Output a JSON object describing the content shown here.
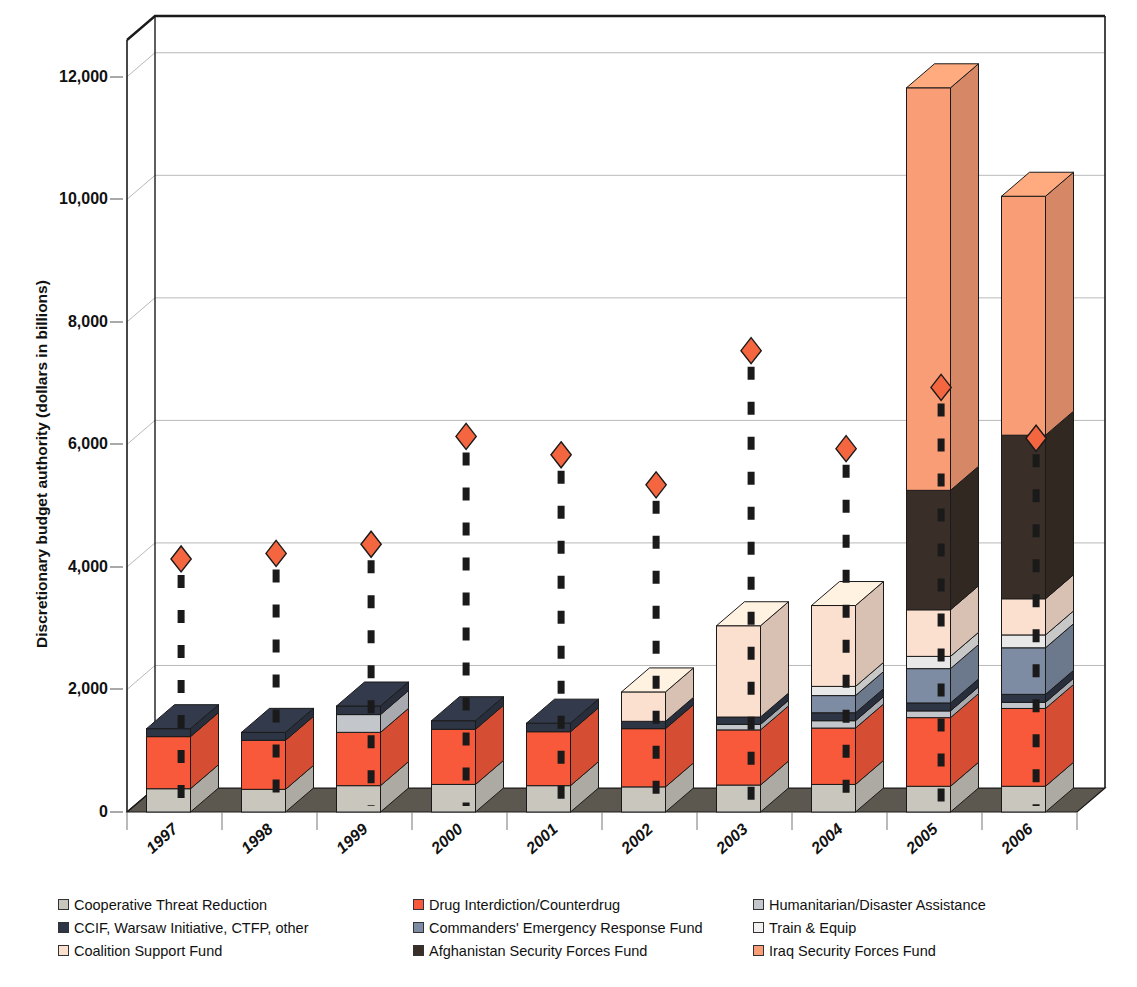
{
  "chart_data": {
    "type": "bar",
    "subtype": "stacked-bar-3d-with-scatter-overlay",
    "title": "",
    "xlabel": "",
    "ylabel": "Discretionary budget authority (dollars in billions)",
    "ylim": [
      0,
      12600
    ],
    "yticks": [
      0,
      2000,
      4000,
      6000,
      8000,
      10000,
      12000
    ],
    "ytick_labels": [
      "0",
      "2,000",
      "4,000",
      "6,000",
      "8,000",
      "10,000",
      "12,000"
    ],
    "grid": true,
    "legend_position": "bottom",
    "categories": [
      "1997",
      "1998",
      "1999",
      "2000",
      "2001",
      "2002",
      "2003",
      "2004",
      "2005",
      "2006"
    ],
    "series": [
      {
        "name": "Cooperative Threat Reduction",
        "color": "#c9c6bd",
        "values": [
          380,
          370,
          430,
          450,
          430,
          410,
          440,
          450,
          420,
          420
        ]
      },
      {
        "name": "Drug Interdiction/Counterdrug",
        "color": "#f8593a",
        "values": [
          850,
          800,
          870,
          900,
          880,
          950,
          900,
          920,
          1120,
          1270
        ]
      },
      {
        "name": "Humanitarian/Disaster Assistance",
        "color": "#c3c6cb",
        "values": [
          0,
          0,
          290,
          0,
          0,
          0,
          90,
          120,
          110,
          100
        ]
      },
      {
        "name": "CCIF, Warsaw Initiative, CTFP, other",
        "color": "#2e3645",
        "values": [
          130,
          130,
          140,
          140,
          140,
          120,
          120,
          130,
          130,
          130
        ]
      },
      {
        "name": "Commanders' Emergency Response Fund",
        "color": "#7d8ba3",
        "values": [
          0,
          0,
          0,
          0,
          0,
          0,
          0,
          280,
          560,
          760
        ]
      },
      {
        "name": "Train & Equip",
        "color": "#e8e8e8",
        "values": [
          0,
          0,
          0,
          0,
          0,
          0,
          0,
          150,
          200,
          210
        ]
      },
      {
        "name": "Coalition Support Fund",
        "color": "#fbe0d0",
        "values": [
          0,
          0,
          0,
          0,
          0,
          480,
          1490,
          1320,
          760,
          590
        ]
      },
      {
        "name": "Afghanistan Security Forces Fund",
        "color": "#3a2f28",
        "values": [
          0,
          0,
          0,
          0,
          0,
          0,
          0,
          0,
          1950,
          2670
        ]
      },
      {
        "name": "Iraq Security Forces Fund",
        "color": "#f99d76",
        "values": [
          0,
          0,
          0,
          0,
          0,
          0,
          0,
          0,
          6570,
          3900
        ]
      }
    ],
    "marker_series": {
      "name": "Total (diamond marker)",
      "marker": "diamond",
      "color": "#f4663f",
      "values": [
        4130,
        4220,
        4370,
        6130,
        5830,
        5340,
        7530,
        5930,
        6930,
        6100
      ]
    }
  },
  "axis": {
    "y_label": "Discretionary budget authority (dollars in billions)",
    "y_tick_labels": [
      "12,000",
      "10,000",
      "8,000",
      "6,000",
      "4,000",
      "2,000",
      "0"
    ],
    "x_tick_labels": [
      "1997",
      "1998",
      "1999",
      "2000",
      "2001",
      "2002",
      "2003",
      "2004",
      "2005",
      "2006"
    ]
  },
  "legend": {
    "items": [
      {
        "label": "Cooperative Threat Reduction",
        "color": "#c9c6bd"
      },
      {
        "label": "Drug Interdiction/Counterdrug",
        "color": "#f8593a"
      },
      {
        "label": "Humanitarian/Disaster Assistance",
        "color": "#c3c6cb"
      },
      {
        "label": "CCIF, Warsaw Initiative, CTFP, other",
        "color": "#2e3645"
      },
      {
        "label": "Commanders' Emergency Response Fund",
        "color": "#7d8ba3"
      },
      {
        "label": "Train & Equip",
        "color": "#f2f1ef"
      },
      {
        "label": "Coalition Support Fund",
        "color": "#fbe0d0"
      },
      {
        "label": "Afghanistan Security Forces Fund",
        "color": "#3a2f28"
      },
      {
        "label": "Iraq Security Forces Fund",
        "color": "#f99d76"
      }
    ]
  },
  "colors": {
    "floor": "#5c584f",
    "gridline": "#b9b9b9",
    "frame": "#1a1a1a",
    "marker": "#f4663f",
    "stem": "#1a1a1a"
  }
}
